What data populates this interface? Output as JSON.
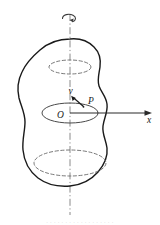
{
  "figure": {
    "type": "mechanics-diagram",
    "background_color": "#ffffff",
    "outline_color": "#1a1a1a",
    "axis_color": "#7a7a7a",
    "ellipse_color": "#5a5a5a",
    "vector_color": "#1a1a1a",
    "labels": {
      "origin": "O",
      "velocity": "v",
      "point": "P",
      "x_axis": "x"
    },
    "rotation_arrow": {
      "name": "angular-velocity-arrow",
      "position": "top-of-axis"
    },
    "cross_sections": [
      {
        "name": "upper-ellipse",
        "cx": 70,
        "cy": 67,
        "rx": 21,
        "ry": 7
      },
      {
        "name": "middle-ellipse",
        "cx": 70,
        "cy": 113,
        "rx": 28,
        "ry": 10
      },
      {
        "name": "lower-ellipse",
        "cx": 70,
        "cy": 163,
        "rx": 36,
        "ry": 13
      }
    ],
    "axis_line": {
      "name": "rotation-axis",
      "x": 70,
      "y1": 14,
      "y2": 215
    },
    "x_axis_line": {
      "name": "x-axis",
      "y": 113,
      "x1": 70,
      "x2": 150
    }
  },
  "caption": {
    "text": "· · · · · · · · · · · · · · · · · ·"
  }
}
